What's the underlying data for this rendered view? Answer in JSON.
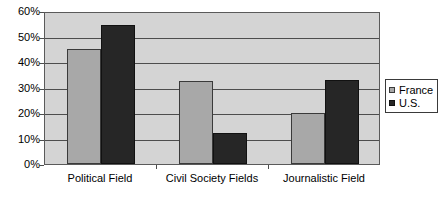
{
  "chart_data": {
    "type": "bar",
    "title": "",
    "subtitle": "",
    "xlabel": "",
    "ylabel": "",
    "ylim": [
      0,
      60
    ],
    "ytick_labels": [
      "60%",
      "50%",
      "40%",
      "30%",
      "20%",
      "10%",
      "0%"
    ],
    "ytick_values": [
      60,
      50,
      40,
      30,
      20,
      10,
      0
    ],
    "grid": true,
    "legend_position": "right",
    "categories": [
      "Political Field",
      "Civil Society Fields",
      "Journalistic Field"
    ],
    "series": [
      {
        "name": "France",
        "color": "#a8a8a8",
        "values": [
          45,
          32.5,
          20
        ]
      },
      {
        "name": "U.S.",
        "color": "#262626",
        "values": [
          54.5,
          12,
          33
        ]
      }
    ]
  },
  "legend": {
    "entries": [
      {
        "label": "France",
        "swatch_name": "legend-swatch-france"
      },
      {
        "label": "U.S.",
        "swatch_name": "legend-swatch-us"
      }
    ]
  },
  "axes": {
    "y": {
      "labels": [
        "60%",
        "50%",
        "40%",
        "30%",
        "20%",
        "10%",
        "0%"
      ]
    },
    "x": {
      "labels": [
        "Political Field",
        "Civil Society Fields",
        "Journalistic Field"
      ]
    }
  }
}
